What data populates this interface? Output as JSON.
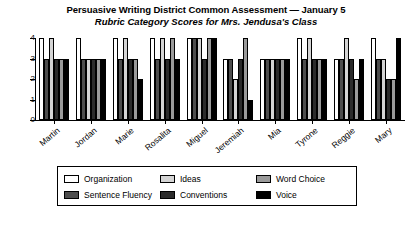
{
  "chart_data": {
    "type": "bar",
    "title": "Persuasive Writing District Common Assessment — January 5",
    "subtitle": "Rubric Category Scores for Mrs. Jendusa's Class",
    "xlabel": "",
    "ylabel": "",
    "ylim": [
      0,
      4
    ],
    "yticks": [
      "0",
      "1",
      "2",
      "3",
      "4"
    ],
    "grid": false,
    "legend_position": "bottom",
    "categories": [
      "Martin",
      "Jordan",
      "Marie",
      "Rosalita",
      "Miguel",
      "Jeremiah",
      "Mia",
      "Tyrone",
      "Reggie",
      "Mary"
    ],
    "series": [
      {
        "name": "Organization",
        "color": "#ffffff",
        "values": [
          4,
          4,
          4,
          4,
          4,
          3,
          3,
          4,
          3,
          4
        ]
      },
      {
        "name": "Sentence Fluency",
        "color": "#4d4d4d",
        "values": [
          3,
          3,
          3,
          3,
          4,
          3,
          3,
          3,
          3,
          3
        ]
      },
      {
        "name": "Ideas",
        "color": "#d4d4d4",
        "values": [
          4,
          3,
          4,
          4,
          4,
          2,
          3,
          4,
          4,
          3
        ]
      },
      {
        "name": "Conventions",
        "color": "#2b2b2b",
        "values": [
          3,
          3,
          3,
          3,
          3,
          3,
          3,
          3,
          3,
          2
        ]
      },
      {
        "name": "Word Choice",
        "color": "#9a9a9a",
        "values": [
          3,
          3,
          3,
          4,
          4,
          4,
          3,
          3,
          2,
          2
        ]
      },
      {
        "name": "Voice",
        "color": "#000000",
        "values": [
          3,
          3,
          2,
          3,
          4,
          1,
          3,
          3,
          3,
          4
        ]
      }
    ]
  },
  "legend": {
    "items": [
      {
        "label": "Organization",
        "color": "#ffffff",
        "icon": "legend-swatch-organization"
      },
      {
        "label": "Ideas",
        "color": "#d4d4d4",
        "icon": "legend-swatch-ideas"
      },
      {
        "label": "Word Choice",
        "color": "#9a9a9a",
        "icon": "legend-swatch-word-choice"
      },
      {
        "label": "Sentence Fluency",
        "color": "#4d4d4d",
        "icon": "legend-swatch-sentence-fluency"
      },
      {
        "label": "Conventions",
        "color": "#2b2b2b",
        "icon": "legend-swatch-conventions"
      },
      {
        "label": "Voice",
        "color": "#000000",
        "icon": "legend-swatch-voice"
      }
    ]
  }
}
